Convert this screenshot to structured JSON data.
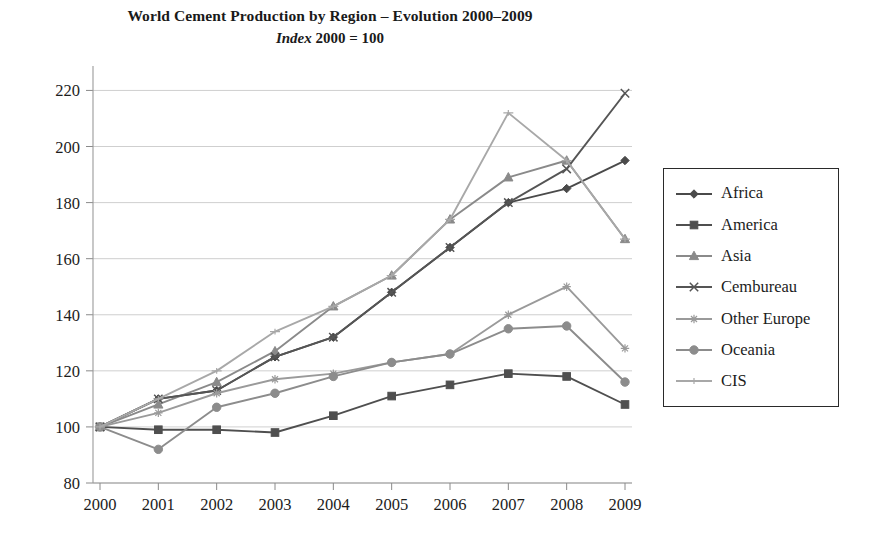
{
  "chart_data": {
    "type": "line",
    "title": "World Cement Production by Region – Evolution 2000–2009",
    "subtitle_italic": "Index",
    "subtitle_rest": " 2000 = 100",
    "xlabel": "",
    "ylabel": "",
    "x": [
      2000,
      2001,
      2002,
      2003,
      2004,
      2005,
      2006,
      2007,
      2008,
      2009
    ],
    "categories": [
      "2000",
      "2001",
      "2002",
      "2003",
      "2004",
      "2005",
      "2006",
      "2007",
      "2008",
      "2009"
    ],
    "xtick_labels": [
      "2000",
      "2001",
      "2002",
      "2003",
      "2004",
      "2005",
      "2006",
      "2007",
      "2008",
      "2009"
    ],
    "ytick_labels": [
      "80",
      "100",
      "120",
      "140",
      "160",
      "180",
      "200",
      "220"
    ],
    "yticks": [
      80,
      100,
      120,
      140,
      160,
      180,
      200,
      220
    ],
    "ylim": [
      80,
      228
    ],
    "xlim": [
      1999.85,
      2009.3
    ],
    "grid": true,
    "grid_axis": "y",
    "legend_position": "right-outside",
    "series": [
      {
        "name": "Africa",
        "marker": "diamond",
        "color": "#4a4a4a",
        "values": [
          100,
          110,
          113,
          125,
          132,
          148,
          164,
          180,
          185,
          195
        ]
      },
      {
        "name": "America",
        "marker": "square",
        "color": "#4f4f4f",
        "values": [
          100,
          99,
          99,
          98,
          104,
          111,
          115,
          119,
          118,
          108
        ]
      },
      {
        "name": "Asia",
        "marker": "triangle",
        "color": "#8a8a8a",
        "values": [
          100,
          108,
          116,
          127,
          143,
          154,
          174,
          189,
          195,
          167
        ]
      },
      {
        "name": "Cembureau",
        "marker": "cross",
        "color": "#555555",
        "values": [
          100,
          110,
          113,
          125,
          132,
          148,
          164,
          180,
          192,
          219
        ]
      },
      {
        "name": "Other Europe",
        "marker": "star",
        "color": "#9a9a9a",
        "values": [
          100,
          105,
          112,
          117,
          119,
          123,
          126,
          140,
          150,
          128
        ]
      },
      {
        "name": "Oceania",
        "marker": "circle",
        "color": "#8c8c8c",
        "values": [
          100,
          92,
          107,
          112,
          118,
          123,
          126,
          135,
          136,
          116
        ]
      },
      {
        "name": "CIS",
        "marker": "line",
        "color": "#a8a8a8",
        "values": [
          100,
          110,
          120,
          134,
          143,
          154,
          174,
          212,
          195,
          167
        ]
      }
    ]
  },
  "legend": {
    "items": [
      {
        "label": "Africa"
      },
      {
        "label": "America"
      },
      {
        "label": "Asia"
      },
      {
        "label": "Cembureau"
      },
      {
        "label": "Other Europe"
      },
      {
        "label": "Oceania"
      },
      {
        "label": "CIS"
      }
    ]
  }
}
